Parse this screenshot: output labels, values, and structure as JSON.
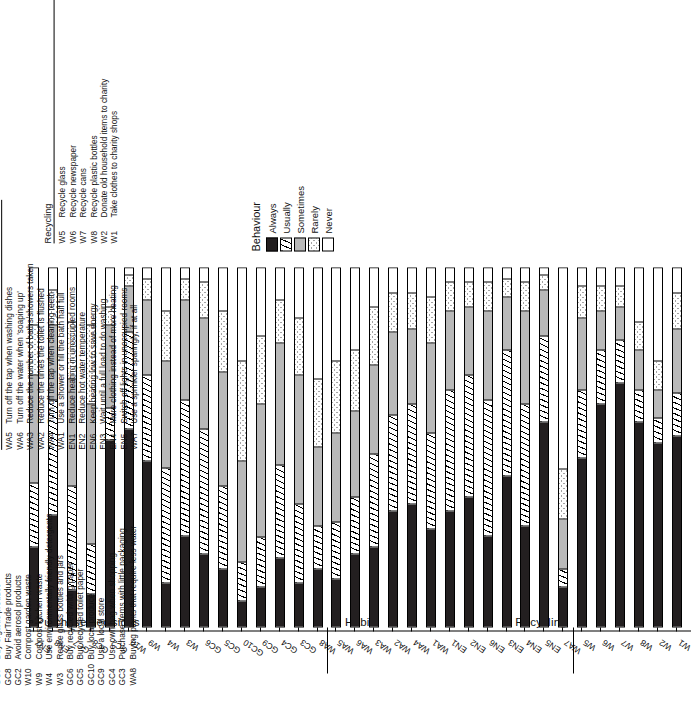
{
  "legend": {
    "title": "Behaviour",
    "items": [
      {
        "label": "Always",
        "pattern": "solid-black",
        "color": "#231f20"
      },
      {
        "label": "Usually",
        "pattern": "diagonal-hatch",
        "color": "#ffffff"
      },
      {
        "label": "Sometimes",
        "pattern": "solid-gray",
        "color": "#b9b9b9"
      },
      {
        "label": "Rarely",
        "pattern": "dotted",
        "color": "#ffffff"
      },
      {
        "label": "Never",
        "pattern": "blank-white",
        "color": "#ffffff"
      }
    ]
  },
  "groups": [
    {
      "name": "Purchase decisions"
    },
    {
      "name": "Habits"
    },
    {
      "name": "Recycling"
    }
  ],
  "key_lists": [
    {
      "heading": "Purchase decisions",
      "entries": [
        {
          "code": "EN7",
          "text": "Use high efficiency light bulbs"
        },
        {
          "code": "EN8",
          "text": "Use high efficiency appliances"
        },
        {
          "code": "GC7",
          "text": "Buy organic produce"
        },
        {
          "code": "GC8",
          "text": "Buy FairTrade products"
        },
        {
          "code": "GC2",
          "text": "Avoid aerosol products"
        },
        {
          "code": "W10",
          "text": "Compost garden waste"
        },
        {
          "code": "W9",
          "text": "Compost kitchen waste"
        },
        {
          "code": "W4",
          "text": "Use environmentally friendly detergents"
        },
        {
          "code": "W3",
          "text": "Reuse glass bottles and jars"
        },
        {
          "code": "GC6",
          "text": "Buy recycled writing paper"
        },
        {
          "code": "GC5",
          "text": "Buy recycled toilet paper"
        },
        {
          "code": "GC10",
          "text": "Buy local produce"
        },
        {
          "code": "GC9",
          "text": "Use a local store"
        },
        {
          "code": "GC4",
          "text": "Use own bag when shopping"
        },
        {
          "code": "GC3",
          "text": "Purchase items with little packaging"
        },
        {
          "code": "WA8",
          "text": "Buying plants that require less water"
        }
      ]
    },
    {
      "heading": "Habits",
      "entries": [
        {
          "code": "WA5",
          "text": "Turn off the tap when washing dishes"
        },
        {
          "code": "WA6",
          "text": "Turn off the water when 'soaping up'"
        },
        {
          "code": "WA3",
          "text": "Reduce the number of baths/showers taken"
        },
        {
          "code": "WA2",
          "text": "Reduce the times the toilet is flushed"
        },
        {
          "code": "WA4",
          "text": "Turn off the tap when cleaning teeth"
        },
        {
          "code": "WA1",
          "text": "Use a shower or fill the bath half full"
        },
        {
          "code": "EN1",
          "text": "Reduce heating in unoccupied rooms"
        },
        {
          "code": "EN2",
          "text": "Reduce hot water temperature"
        },
        {
          "code": "EN6",
          "text": "Keep heating low to save energy"
        },
        {
          "code": "EN3",
          "text": "Wait until a full load to do washing"
        },
        {
          "code": "EN4",
          "text": "More clothing instead of more heating"
        },
        {
          "code": "EN5",
          "text": "Switch off lights in unoccupied rooms"
        },
        {
          "code": "WA7",
          "text": "Use a sprinkler sparingly, if at all"
        }
      ]
    },
    {
      "heading": "Recycling",
      "entries": [
        {
          "code": "W5",
          "text": "Recycle glass"
        },
        {
          "code": "W6",
          "text": "Recycle newspaper"
        },
        {
          "code": "W7",
          "text": "Recycle cans"
        },
        {
          "code": "W8",
          "text": "Recycle plastic bottles"
        },
        {
          "code": "W2",
          "text": "Donate old household items to charity"
        },
        {
          "code": "W1",
          "text": "Take clothes to charity shops"
        }
      ]
    }
  ],
  "chart_data": {
    "type": "bar",
    "orientation": "horizontal-stacked-100pct",
    "title": "",
    "xlabel": "",
    "ylabel": "",
    "xlim": [
      0,
      100
    ],
    "grid": false,
    "legend_position": "right",
    "series": [
      {
        "name": "Always",
        "pattern": "solid-black"
      },
      {
        "name": "Usually",
        "pattern": "diagonal-hatch"
      },
      {
        "name": "Sometimes",
        "pattern": "solid-gray"
      },
      {
        "name": "Rarely",
        "pattern": "dotted"
      },
      {
        "name": "Never",
        "pattern": "blank-white"
      }
    ],
    "group_boundaries": [
      {
        "name": "Purchase decisions",
        "from": "EN7",
        "to": "WA8"
      },
      {
        "name": "Habits",
        "from": "WA5",
        "to": "WA7"
      },
      {
        "name": "Recycling",
        "from": "W5",
        "to": "W1"
      }
    ],
    "categories": [
      "EN7",
      "EN8",
      "GC7",
      "GC8",
      "GC2",
      "W10",
      "W9",
      "W4",
      "W3",
      "GC6",
      "GC5",
      "GC10",
      "GC9",
      "GC4",
      "GC3",
      "WA8",
      "WA5",
      "WA6",
      "WA3",
      "WA2",
      "WA4",
      "WA1",
      "EN1",
      "EN2",
      "EN6",
      "EN3",
      "EN4",
      "EN5",
      "WA7",
      "W5",
      "W6",
      "W7",
      "W8",
      "W2",
      "W1"
    ],
    "values": [
      [
        22,
        18,
        30,
        14,
        16
      ],
      [
        31,
        32,
        21,
        10,
        6
      ],
      [
        10,
        29,
        30,
        16,
        15
      ],
      [
        9,
        14,
        39,
        22,
        16
      ],
      [
        52,
        9,
        23,
        5,
        11
      ],
      [
        55,
        27,
        13,
        3,
        2
      ],
      [
        46,
        24,
        21,
        6,
        3
      ],
      [
        12,
        32,
        30,
        14,
        12
      ],
      [
        25,
        38,
        28,
        6,
        3
      ],
      [
        20,
        35,
        31,
        10,
        4
      ],
      [
        16,
        23,
        32,
        17,
        12
      ],
      [
        7,
        11,
        28,
        28,
        26
      ],
      [
        11,
        14,
        37,
        19,
        19
      ],
      [
        19,
        26,
        34,
        12,
        9
      ],
      [
        12,
        22,
        36,
        16,
        14
      ],
      [
        16,
        12,
        22,
        19,
        31
      ],
      [
        13,
        16,
        25,
        20,
        26
      ],
      [
        20,
        16,
        24,
        17,
        23
      ],
      [
        22,
        26,
        25,
        16,
        11
      ],
      [
        32,
        27,
        23,
        11,
        7
      ],
      [
        34,
        28,
        21,
        10,
        7
      ],
      [
        27,
        27,
        25,
        13,
        8
      ],
      [
        32,
        34,
        22,
        8,
        4
      ],
      [
        36,
        34,
        19,
        7,
        4
      ],
      [
        25,
        38,
        25,
        8,
        4
      ],
      [
        42,
        35,
        15,
        5,
        3
      ],
      [
        28,
        34,
        26,
        8,
        4
      ],
      [
        57,
        24,
        13,
        4,
        2
      ],
      [
        11,
        5,
        14,
        14,
        56
      ],
      [
        47,
        19,
        20,
        9,
        5
      ],
      [
        62,
        15,
        11,
        7,
        5
      ],
      [
        68,
        12,
        9,
        6,
        5
      ],
      [
        57,
        9,
        11,
        8,
        15
      ],
      [
        51,
        7,
        8,
        8,
        26
      ],
      [
        53,
        12,
        18,
        10,
        7
      ]
    ]
  }
}
